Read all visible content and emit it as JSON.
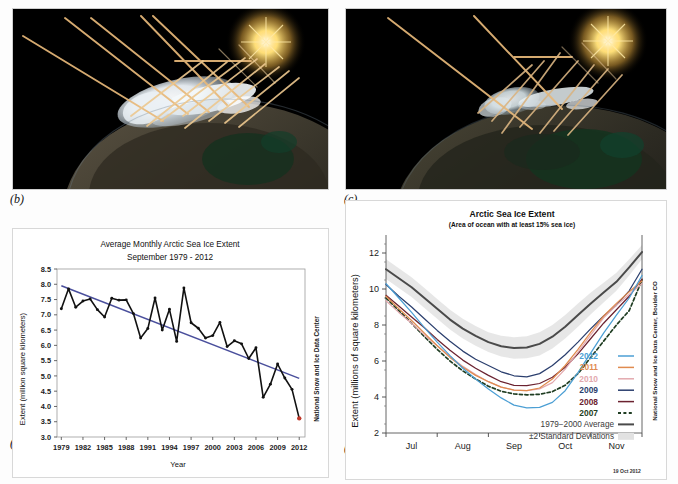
{
  "figure": {
    "panel_labels": {
      "b": "(b)",
      "c": "(c)",
      "a": "(a)",
      "d": "(d)"
    }
  },
  "panel_b": {
    "name": "arctic-sea-ice-high-albedo-illustration",
    "description": "Earth seen from space at night with bright white Arctic sea ice; sunlight rays strike the ice and reflect back to space",
    "sun_color": "#ffdf7a",
    "ray_color": "#e8b97a",
    "ice_color": "#eef2f5",
    "space_color": "#000000"
  },
  "panel_c": {
    "name": "arctic-sea-ice-low-albedo-illustration",
    "description": "Earth seen from space at night with reduced Arctic sea ice; sunlight rays penetrate to darker ocean and are absorbed",
    "sun_color": "#ffdf7a",
    "ray_color": "#e8b97a",
    "ice_color": "#dfe8ea",
    "space_color": "#000000"
  },
  "chart_a": {
    "credit": "National Snow and Ice Data Center",
    "trend_color": "#4a4f9c",
    "series_color": "#111111",
    "highlight_color": "#c0392b"
  },
  "chart_d": {
    "credit": "National Snow and Ice Data Center, Boulder CO",
    "datestamp": "19 Oct 2012",
    "legend": [
      {
        "label": "2012",
        "color": "#4c9fd4",
        "style": "solid"
      },
      {
        "label": "2011",
        "color": "#e08b4f",
        "style": "solid"
      },
      {
        "label": "2010",
        "color": "#e3a9ae",
        "style": "solid"
      },
      {
        "label": "2009",
        "color": "#2b3f6e",
        "style": "solid"
      },
      {
        "label": "2008",
        "color": "#6b2230",
        "style": "solid"
      },
      {
        "label": "2007",
        "color": "#1f3d22",
        "style": "dashed"
      },
      {
        "label": "1979−2000 Average",
        "color": "#4a4a4a",
        "style": "solid"
      },
      {
        "label": "±2 Standard Deviations",
        "color": "#e2e2e2",
        "style": "band"
      }
    ]
  },
  "chart_data": [
    {
      "id": "panel-a",
      "type": "line",
      "title": "Average Monthly Arctic Sea Ice Extent",
      "subtitle": "September 1979 - 2012",
      "xlabel": "Year",
      "ylabel": "Extent (million square kilometers)",
      "xlim": [
        1978.4,
        2012.8
      ],
      "ylim": [
        3.0,
        8.5
      ],
      "yticks": [
        3.0,
        3.5,
        4.0,
        4.5,
        5.0,
        5.5,
        6.0,
        6.5,
        7.0,
        7.5,
        8.0,
        8.5
      ],
      "ytick_labels": [
        "3.0",
        "3.5",
        "4.0",
        "4.5",
        "5.0",
        "5.5",
        "6.0",
        "6.5",
        "7.0",
        "7.5",
        "8.0",
        "8.5"
      ],
      "xticks": [
        1979,
        1982,
        1985,
        1988,
        1991,
        1994,
        1997,
        2000,
        2003,
        2006,
        2009,
        2012
      ],
      "xtick_labels": [
        "1979",
        "1982",
        "1985",
        "1988",
        "1991",
        "1994",
        "1997",
        "2000",
        "2003",
        "2006",
        "2009",
        "2012"
      ],
      "grid": false,
      "x": [
        1979,
        1980,
        1981,
        1982,
        1983,
        1984,
        1985,
        1986,
        1987,
        1988,
        1989,
        1990,
        1991,
        1992,
        1993,
        1994,
        1995,
        1996,
        1997,
        1998,
        1999,
        2000,
        2001,
        2002,
        2003,
        2004,
        2005,
        2006,
        2007,
        2008,
        2009,
        2010,
        2011,
        2012
      ],
      "values": [
        7.2,
        7.85,
        7.25,
        7.45,
        7.52,
        7.17,
        6.93,
        7.54,
        7.48,
        7.49,
        7.04,
        6.24,
        6.55,
        7.55,
        6.5,
        7.18,
        6.13,
        7.88,
        6.74,
        6.56,
        6.24,
        6.32,
        6.75,
        5.96,
        6.15,
        6.05,
        5.57,
        5.92,
        4.3,
        4.73,
        5.39,
        4.93,
        4.56,
        3.61
      ],
      "trendline": {
        "label": "linear trend",
        "x": [
          1979,
          2012
        ],
        "y": [
          7.95,
          4.92
        ]
      },
      "highlight_points": [
        {
          "x": 2012,
          "y": 3.61
        }
      ]
    },
    {
      "id": "panel-d",
      "type": "line",
      "title": "Arctic Sea Ice Extent",
      "subtitle": "(Area of ocean with at least 15% sea ice)",
      "xlabel": "",
      "ylabel": "Extent (millions of square kilometers)",
      "xlim": [
        0,
        5
      ],
      "ylim": [
        2,
        13
      ],
      "yticks": [
        2,
        4,
        6,
        8,
        10,
        12
      ],
      "ytick_labels": [
        "2",
        "4",
        "6",
        "8",
        "10",
        "12"
      ],
      "xticks": [
        0.5,
        1.5,
        2.5,
        3.5,
        4.5
      ],
      "xtick_labels": [
        "Jul",
        "Aug",
        "Sep",
        "Oct",
        "Nov"
      ],
      "grid": false,
      "x": [
        0,
        0.25,
        0.5,
        0.75,
        1,
        1.25,
        1.5,
        1.75,
        2,
        2.25,
        2.5,
        2.75,
        3,
        3.25,
        3.5,
        3.75,
        4,
        4.25,
        4.5,
        4.75,
        5
      ],
      "series": [
        {
          "name": "1979−2000 Average",
          "color": "#4a4a4a",
          "style": "solid",
          "values": [
            11.1,
            10.6,
            10.1,
            9.5,
            8.9,
            8.3,
            7.8,
            7.4,
            7.05,
            6.82,
            6.72,
            6.75,
            6.95,
            7.35,
            7.9,
            8.55,
            9.2,
            9.8,
            10.4,
            11.2,
            12.05
          ]
        },
        {
          "name": "+2 Standard Deviations",
          "color": "#e2e2e2",
          "style": "band-upper",
          "values": [
            11.65,
            11.15,
            10.65,
            10.05,
            9.45,
            8.85,
            8.35,
            7.95,
            7.6,
            7.4,
            7.32,
            7.38,
            7.6,
            8.0,
            8.55,
            9.2,
            9.8,
            10.35,
            10.9,
            11.65,
            12.45
          ]
        },
        {
          "name": "−2 Standard Deviations",
          "color": "#e2e2e2",
          "style": "band-lower",
          "values": [
            10.55,
            10.05,
            9.55,
            8.95,
            8.35,
            7.75,
            7.25,
            6.85,
            6.5,
            6.25,
            6.12,
            6.15,
            6.3,
            6.7,
            7.25,
            7.9,
            8.6,
            9.25,
            9.9,
            10.75,
            11.65
          ]
        },
        {
          "name": "2007",
          "color": "#1f3d22",
          "style": "dashed",
          "values": [
            9.5,
            8.8,
            8.1,
            7.35,
            6.65,
            6.0,
            5.45,
            5.0,
            4.6,
            4.32,
            4.17,
            4.12,
            4.15,
            4.3,
            4.65,
            5.3,
            6.2,
            7.1,
            8.0,
            8.8,
            10.5
          ]
        },
        {
          "name": "2008",
          "color": "#6b2230",
          "style": "solid",
          "values": [
            9.65,
            9.05,
            8.45,
            7.85,
            7.2,
            6.6,
            6.05,
            5.6,
            5.2,
            4.85,
            4.65,
            4.63,
            4.75,
            5.1,
            5.65,
            6.4,
            7.25,
            8.1,
            8.85,
            9.6,
            10.55
          ]
        },
        {
          "name": "2009",
          "color": "#2b3f6e",
          "style": "solid",
          "values": [
            10.25,
            9.6,
            9.0,
            8.35,
            7.7,
            7.1,
            6.55,
            6.1,
            5.75,
            5.4,
            5.18,
            5.12,
            5.3,
            5.75,
            6.35,
            7.05,
            7.8,
            8.5,
            9.1,
            9.9,
            11.1
          ]
        },
        {
          "name": "2010",
          "color": "#e3a9ae",
          "style": "solid",
          "values": [
            9.35,
            8.7,
            8.1,
            7.45,
            6.85,
            6.25,
            5.7,
            5.25,
            4.85,
            4.55,
            4.38,
            4.35,
            4.45,
            4.8,
            5.55,
            6.5,
            7.45,
            8.4,
            9.1,
            9.7,
            10.3
          ]
        },
        {
          "name": "2011",
          "color": "#e08b4f",
          "style": "solid",
          "values": [
            9.6,
            8.9,
            8.25,
            7.55,
            6.85,
            6.2,
            5.65,
            5.2,
            4.85,
            4.55,
            4.38,
            4.35,
            4.5,
            5.0,
            5.75,
            6.65,
            7.6,
            8.5,
            9.2,
            9.85,
            10.45
          ]
        },
        {
          "name": "2012",
          "color": "#4c9fd4",
          "style": "solid",
          "values": [
            10.3,
            9.5,
            8.7,
            7.85,
            7.05,
            6.3,
            5.6,
            5.0,
            4.45,
            3.95,
            3.55,
            3.4,
            3.42,
            3.7,
            4.35,
            5.35,
            6.45,
            7.55,
            8.55,
            9.5,
            10.75
          ]
        }
      ]
    }
  ]
}
